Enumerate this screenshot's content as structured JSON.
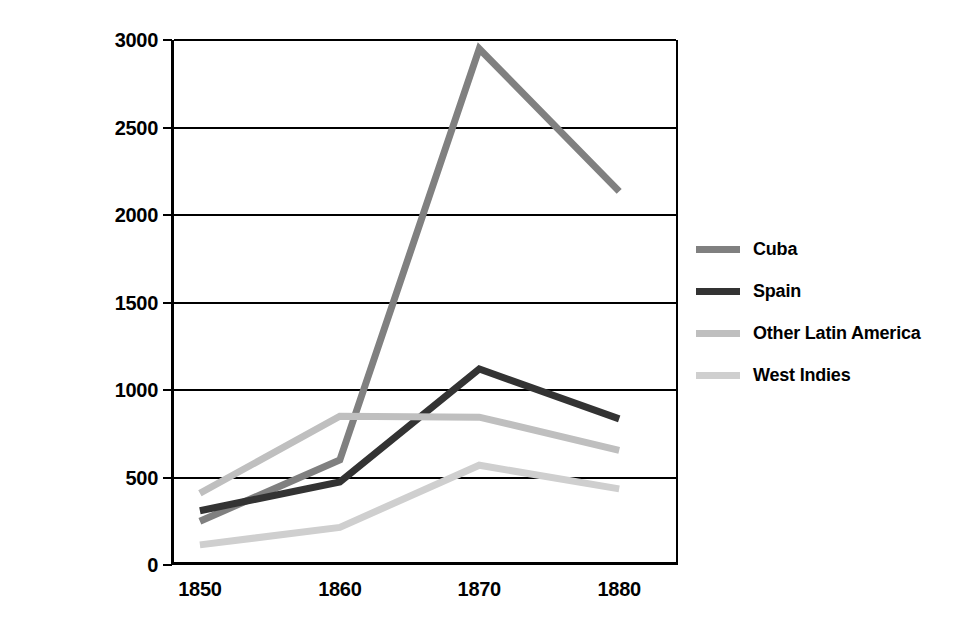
{
  "chart_data": {
    "type": "line",
    "title": "",
    "subtitle": "",
    "xlabel": "",
    "ylabel": "",
    "categories": [
      "1850",
      "1860",
      "1870",
      "1880"
    ],
    "x_tick_labels": [
      "1850",
      "1860",
      "1870",
      "1880"
    ],
    "y_tick_labels": [
      "0",
      "500",
      "1000",
      "1500",
      "2000",
      "2500",
      "3000"
    ],
    "y_tick_values": [
      0,
      500,
      1000,
      1500,
      2000,
      2500,
      3000
    ],
    "ylim": [
      0,
      3000
    ],
    "grid": "horizontal",
    "legend_position": "right",
    "series": [
      {
        "name": "Cuba",
        "color": "#808080",
        "values": [
          250,
          600,
          2950,
          2135
        ]
      },
      {
        "name": "Spain",
        "color": "#333333",
        "values": [
          310,
          475,
          1120,
          835
        ]
      },
      {
        "name": "Other Latin America",
        "color": "#bfbfbf",
        "values": [
          410,
          850,
          845,
          655
        ]
      },
      {
        "name": "West Indies",
        "color": "#cfcfcf",
        "values": [
          115,
          215,
          570,
          435
        ]
      }
    ]
  },
  "legend": {
    "items": [
      {
        "label": "Cuba",
        "color": "#808080"
      },
      {
        "label": "Spain",
        "color": "#333333"
      },
      {
        "label": "Other Latin America",
        "color": "#bfbfbf"
      },
      {
        "label": "West Indies",
        "color": "#cfcfcf"
      }
    ]
  }
}
